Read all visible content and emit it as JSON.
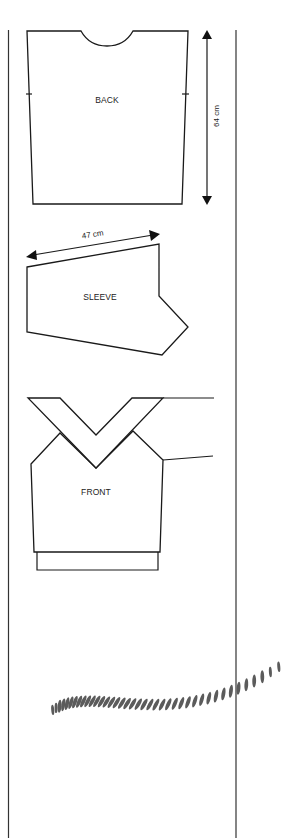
{
  "diagram": {
    "type": "knitting-pattern-schematic",
    "pieces": [
      {
        "id": "back",
        "label": "BACK",
        "dimension": {
          "label": "64 cm",
          "orientation": "vertical"
        }
      },
      {
        "id": "sleeve",
        "label": "SLEEVE",
        "dimension": {
          "label": "47 cm",
          "orientation": "diagonal"
        }
      },
      {
        "id": "front",
        "label": "FRONT"
      }
    ],
    "decoration": {
      "name": "rope-cable-illustration",
      "color": "#5b5b5b"
    },
    "colors": {
      "line": "#1a1a1a",
      "background": "#ffffff"
    }
  }
}
